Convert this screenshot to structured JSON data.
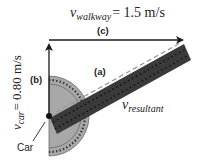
{
  "title_label": {
    "symbol": "v",
    "subscript": "walkway",
    "value_text": "= 1.5 m/s"
  },
  "vertical_label": {
    "symbol": "v",
    "subscript": "car",
    "value_text": "= 0.80 m/s"
  },
  "resultant_label": {
    "symbol": "v",
    "subscript": "resultant"
  },
  "markers": {
    "a": "(a)",
    "b": "(b)",
    "c": "(c)"
  },
  "car_label": "Car",
  "colors": {
    "arrow": "#1a1a1a",
    "protractor_fill": "#a8a8a8",
    "protractor_edge": "#555555",
    "ruler_fill": "#3a3a3a",
    "ruler_dots": "#111111",
    "dashed_line": "#9a9a9a",
    "text": "#222222"
  }
}
